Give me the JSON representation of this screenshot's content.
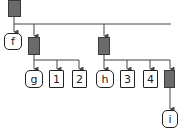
{
  "diagram": {
    "type": "tree",
    "colors": {
      "internal_node": "#6a6a6a",
      "leaf_border": "#222222",
      "edge": "#444444"
    },
    "nodes": [
      {
        "id": "root",
        "kind": "internal",
        "label": ""
      },
      {
        "id": "f",
        "kind": "leaf-round",
        "label": "f"
      },
      {
        "id": "n2",
        "kind": "internal",
        "label": ""
      },
      {
        "id": "n3",
        "kind": "internal",
        "label": ""
      },
      {
        "id": "g",
        "kind": "leaf-round",
        "label": "g"
      },
      {
        "id": "v1",
        "kind": "leaf-square",
        "label": "1"
      },
      {
        "id": "v2",
        "kind": "leaf-square",
        "label": "2"
      },
      {
        "id": "h",
        "kind": "leaf-round",
        "label": "h"
      },
      {
        "id": "v3",
        "kind": "leaf-square",
        "label": "3"
      },
      {
        "id": "v4",
        "kind": "leaf-square",
        "label": "4"
      },
      {
        "id": "n4",
        "kind": "internal",
        "label": ""
      },
      {
        "id": "i",
        "kind": "leaf-round",
        "label": "i"
      }
    ],
    "edges": [
      [
        "root",
        "f"
      ],
      [
        "root",
        "n2"
      ],
      [
        "root",
        "n3"
      ],
      [
        "n2",
        "g"
      ],
      [
        "n2",
        "v1"
      ],
      [
        "n2",
        "v2"
      ],
      [
        "n3",
        "h"
      ],
      [
        "n3",
        "v3"
      ],
      [
        "n3",
        "v4"
      ],
      [
        "n3",
        "n4"
      ],
      [
        "n4",
        "i"
      ]
    ]
  },
  "labels": {
    "f": "f",
    "g": "g",
    "v1": "1",
    "v2": "2",
    "h": "h",
    "v3": "3",
    "v4": "4",
    "i": "i"
  }
}
